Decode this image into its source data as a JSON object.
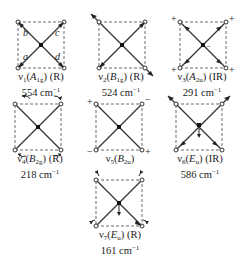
{
  "figure": {
    "type": "vibrational-modes-square-planar",
    "atom_labels": [
      "a",
      "b",
      "c",
      "d"
    ],
    "modes": [
      {
        "id": "v1",
        "number": "1",
        "symmetry": "A",
        "symmetry_sub": "1g",
        "activity": "(R)",
        "frequency": "554",
        "unit": "cm",
        "unit_sup": "−1"
      },
      {
        "id": "v2",
        "number": "2",
        "symmetry": "B",
        "symmetry_sub": "1g",
        "activity": "(R)",
        "frequency": "524",
        "unit": "cm",
        "unit_sup": "−1"
      },
      {
        "id": "v3",
        "number": "3",
        "symmetry": "A",
        "symmetry_sub": "2u",
        "activity": "(IR)",
        "frequency": "291",
        "unit": "cm",
        "unit_sup": "−1"
      },
      {
        "id": "v4",
        "number": "4",
        "symmetry": "B",
        "symmetry_sub": "2g",
        "activity": "(R)",
        "frequency": "218",
        "unit": "cm",
        "unit_sup": "−1"
      },
      {
        "id": "v5",
        "number": "5",
        "symmetry": "B",
        "symmetry_sub": "2u",
        "activity": "",
        "frequency": "",
        "unit": "",
        "unit_sup": ""
      },
      {
        "id": "v6",
        "number": "6",
        "symmetry": "E",
        "symmetry_sub": "u",
        "activity": "(IR)",
        "frequency": "586",
        "unit": "cm",
        "unit_sup": "−1"
      },
      {
        "id": "v7",
        "number": "7",
        "symmetry": "E",
        "symmetry_sub": "u",
        "activity": "(R)",
        "frequency": "161",
        "unit": "cm",
        "unit_sup": "−1"
      }
    ],
    "signs": {
      "plus": "+",
      "minus": "−"
    },
    "colors": {
      "line": "#333333",
      "dash": "#444444"
    }
  }
}
